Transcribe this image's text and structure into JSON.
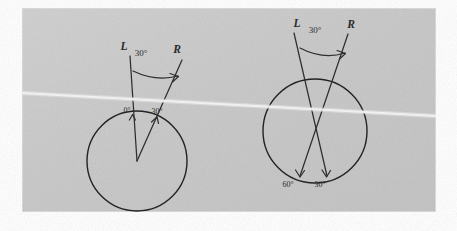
{
  "page": {
    "background_color": "#ffffff",
    "paper_color": "#c9c9c9",
    "ink_color": "#2e2e2e"
  },
  "figures": [
    {
      "id": "left-figure",
      "name": "tangential-rays-diagram",
      "circle": {
        "cx": 137,
        "cy": 161,
        "r": 50
      },
      "vertex": {
        "x": 137,
        "y": 161
      },
      "rays": [
        {
          "name": "ray-L",
          "label": "L",
          "label_x": 124,
          "label_y": 50,
          "from_x": 137,
          "from_y": 161,
          "to_x": 130,
          "to_y": 56,
          "contact_label": "0°",
          "contact_label_x": 127,
          "contact_label_y": 113
        },
        {
          "name": "ray-R",
          "label": "R",
          "label_x": 177,
          "label_y": 53,
          "from_x": 137,
          "from_y": 161,
          "to_x": 182,
          "to_y": 60,
          "contact_label": "30°",
          "contact_label_x": 156,
          "contact_label_y": 114
        }
      ],
      "angle_arc": {
        "label": "30°",
        "label_x": 141,
        "label_y": 56,
        "start_x": 133,
        "start_y": 71,
        "end_x": 178,
        "end_y": 76
      }
    },
    {
      "id": "right-figure",
      "name": "crossed-rays-diagram",
      "circle": {
        "cx": 315,
        "cy": 131,
        "r": 52
      },
      "crossing_point": {
        "x": 313,
        "y": 133
      },
      "rays": [
        {
          "name": "ray-L",
          "label": "L",
          "label_x": 297,
          "label_y": 27,
          "from_x": 294,
          "from_y": 33,
          "to_x": 327,
          "to_y": 176,
          "contact_label": "30°",
          "contact_label_x": 319,
          "contact_label_y": 186
        },
        {
          "name": "ray-R",
          "label": "R",
          "label_x": 351,
          "label_y": 28,
          "from_x": 348,
          "from_y": 34,
          "to_x": 300,
          "to_y": 176,
          "contact_label": "60°",
          "contact_label_x": 288,
          "contact_label_y": 186
        }
      ],
      "angle_arc": {
        "label": "30°",
        "label_x": 313,
        "label_y": 33,
        "start_x": 300,
        "start_y": 48,
        "end_x": 346,
        "end_y": 53
      }
    }
  ],
  "annotations": {
    "scanner_streak": "diagonal white scan line artifact",
    "angle_symbol": "°"
  }
}
